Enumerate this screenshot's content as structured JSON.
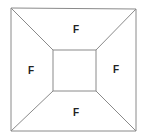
{
  "diagram": {
    "outer": {
      "tl": [
        11,
        8
      ],
      "tr": [
        136,
        9
      ],
      "br": [
        136,
        131
      ],
      "bl": [
        11,
        131
      ]
    },
    "inner": {
      "tl": [
        53,
        50
      ],
      "tr": [
        96,
        50
      ],
      "br": [
        96,
        91
      ],
      "bl": [
        53,
        91
      ]
    },
    "line_color": "#8a8a8a",
    "labels": [
      {
        "id": "top",
        "text": "F",
        "x": 76,
        "y": 33
      },
      {
        "id": "left",
        "text": "F",
        "x": 31,
        "y": 74
      },
      {
        "id": "right",
        "text": "F",
        "x": 116,
        "y": 73
      },
      {
        "id": "bottom",
        "text": "F",
        "x": 76,
        "y": 116
      }
    ]
  }
}
